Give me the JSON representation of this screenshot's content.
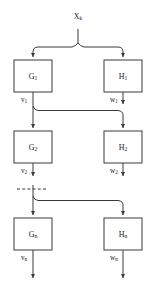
{
  "diagram": {
    "type": "block-diagram",
    "colors": {
      "stroke": "#3a3a3a",
      "box_fill": "#ffffff",
      "text": "#1a1a1a",
      "background": "#ffffff"
    },
    "input": {
      "label_base": "X",
      "label_sub": "k",
      "label_full": "X_k"
    },
    "blocks": [
      {
        "id": "G1",
        "base": "G",
        "sub": "1",
        "column": "left",
        "row": 1,
        "x": 14,
        "y": 60,
        "w": 38,
        "h": 32
      },
      {
        "id": "H1",
        "base": "H",
        "sub": "1",
        "column": "right",
        "row": 1,
        "x": 104,
        "y": 60,
        "w": 38,
        "h": 32
      },
      {
        "id": "G2",
        "base": "G",
        "sub": "2",
        "column": "left",
        "row": 2,
        "x": 14,
        "y": 131,
        "w": 38,
        "h": 32
      },
      {
        "id": "H2",
        "base": "H",
        "sub": "2",
        "column": "right",
        "row": 2,
        "x": 104,
        "y": 131,
        "w": 38,
        "h": 32
      },
      {
        "id": "Gn",
        "base": "G",
        "sub": "n",
        "column": "left",
        "row": 3,
        "x": 14,
        "y": 218,
        "w": 38,
        "h": 32
      },
      {
        "id": "Hn",
        "base": "H",
        "sub": "n",
        "column": "right",
        "row": 3,
        "x": 104,
        "y": 218,
        "w": 38,
        "h": 32
      }
    ],
    "signals": [
      {
        "id": "v1",
        "base": "v",
        "sub": "1",
        "x": 24,
        "y": 100
      },
      {
        "id": "w1",
        "base": "w",
        "sub": "1",
        "x": 114,
        "y": 100
      },
      {
        "id": "v2",
        "base": "v",
        "sub": "2",
        "x": 24,
        "y": 171
      },
      {
        "id": "w2",
        "base": "w",
        "sub": "2",
        "x": 114,
        "y": 171
      },
      {
        "id": "vn",
        "base": "v",
        "sub": "n",
        "x": 24,
        "y": 258
      },
      {
        "id": "wn",
        "base": "w",
        "sub": "n",
        "x": 114,
        "y": 258
      }
    ],
    "continuation": {
      "style": "dashed",
      "label": "",
      "x1": 17,
      "x2": 48,
      "y": 189
    },
    "geometry": {
      "left_axis_x": 33,
      "right_axis_x": 123,
      "input_x": 78,
      "input_drop_y": 29,
      "fork_y": 44
    }
  }
}
